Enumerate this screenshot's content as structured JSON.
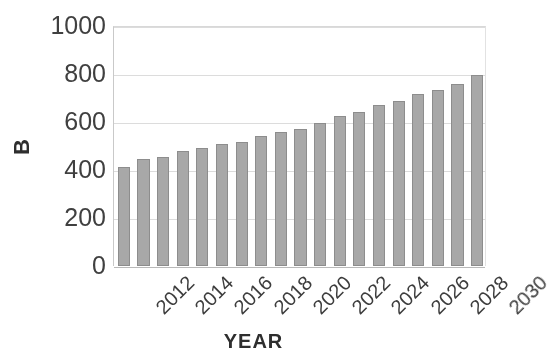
{
  "chart_data": {
    "type": "bar",
    "title": "",
    "xlabel": "YEAR",
    "ylabel": "B",
    "categories": [
      "2012",
      "2013",
      "2014",
      "2015",
      "2016",
      "2017",
      "2018",
      "2019",
      "2020",
      "2021",
      "2022",
      "2023",
      "2024",
      "2025",
      "2026",
      "2027",
      "2028",
      "2029",
      "2030"
    ],
    "values": [
      412,
      447,
      456,
      480,
      492,
      508,
      515,
      540,
      560,
      570,
      597,
      625,
      640,
      670,
      687,
      718,
      735,
      760,
      795
    ],
    "ylim": [
      0,
      1000
    ],
    "yticks": [
      "0",
      "200",
      "400",
      "600",
      "800",
      "1000"
    ],
    "ytick_values": [
      0,
      200,
      400,
      600,
      800,
      1000
    ],
    "visible_xticks": [
      "2012",
      "2014",
      "2016",
      "2018",
      "2020",
      "2022",
      "2024",
      "2026",
      "2028",
      "2030"
    ],
    "xtick_step": 2,
    "grid": true,
    "legend": false,
    "bar_color": "#a8a8a8",
    "bar_border_color": "#8d8d8d",
    "grid_color": "#dcdcdc",
    "axis_color": "#b9b9b9",
    "text_color": "#3d3d3d",
    "background": "#ffffff"
  }
}
